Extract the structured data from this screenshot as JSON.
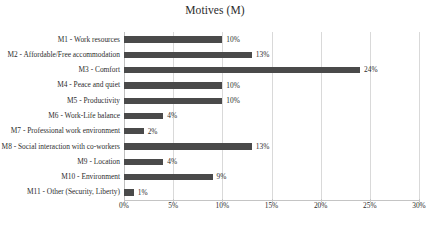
{
  "chart_data": {
    "type": "bar",
    "orientation": "horizontal",
    "title": "Motives (M)",
    "xlabel": "",
    "ylabel": "",
    "xlim": [
      0,
      30
    ],
    "xtick_labels": [
      "0%",
      "5%",
      "10%",
      "15%",
      "20%",
      "25%",
      "30%"
    ],
    "xticks": [
      0,
      5,
      10,
      15,
      20,
      25,
      30
    ],
    "grid": true,
    "legend": null,
    "bar_color": "#4a4a4a",
    "categories": [
      "M1 - Work resources",
      "M2 - Affordable/Free accommodation",
      "M3 - Comfort",
      "M4 - Peace and quiet",
      "M5 - Productivity",
      "M6 - Work-Life balance",
      "M7 - Professional work environment",
      "M8 - Social interaction with co-workers",
      "M9 - Location",
      "M10 - Environment",
      "M11 - Other (Security, Liberty)"
    ],
    "values": [
      10,
      13,
      24,
      10,
      10,
      4,
      2,
      13,
      4,
      9,
      1
    ],
    "data_labels": [
      "10%",
      "13%",
      "24%",
      "10%",
      "10%",
      "4%",
      "2%",
      "13%",
      "4%",
      "9%",
      "1%"
    ]
  }
}
